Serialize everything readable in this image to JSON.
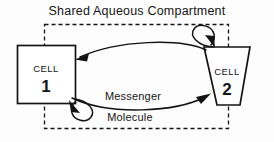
{
  "figure": {
    "title": "Shared Aqueous Compartment",
    "background_color": "#fdfdfd",
    "ink_color": "#141414",
    "container": {
      "name": "shared aqueous compartment",
      "border_style": "dashed",
      "label": "Shared Aqueous Compartment"
    },
    "nodes": [
      {
        "id": "cell1",
        "shape": "square",
        "word": "CELL",
        "number": "1"
      },
      {
        "id": "cell2",
        "shape": "inverted-trapezoid",
        "word": "CELL",
        "number": "2"
      }
    ],
    "flow_label_line1": "Messenger",
    "flow_label_line2": "Molecule",
    "connections": [
      {
        "id": "cell1-to-cell2",
        "from": "cell1",
        "to": "cell2",
        "direction": "lower curve, arrow into cell 2",
        "label": "Messenger Molecule"
      },
      {
        "id": "cell2-to-cell1",
        "from": "cell2",
        "to": "cell1",
        "direction": "upper curve, arrow into cell 1",
        "label": "Messenger Molecule"
      },
      {
        "id": "cell2-self-loop",
        "from": "cell2",
        "to": "cell2",
        "direction": "self loop at top of cell 2",
        "label": ""
      },
      {
        "id": "cell1-self-loop",
        "from": "cell1",
        "to": "cell1",
        "direction": "self loop at bottom of cell 1",
        "label": ""
      }
    ]
  }
}
